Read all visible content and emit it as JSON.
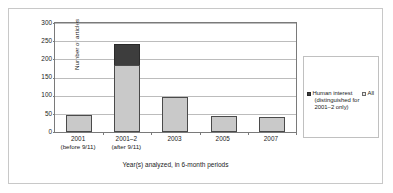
{
  "chart_data": {
    "type": "bar",
    "subtype": "stacked-column",
    "title": "",
    "xlabel": "Year(s) analyzed, in 6-month periods",
    "ylabel": "Number of articles",
    "ylim": [
      0,
      300
    ],
    "yticks": [
      0,
      50,
      100,
      150,
      200,
      250,
      300
    ],
    "grid": true,
    "legend_position": "right-outside-box",
    "categories": [
      "2001 (before 9/11)",
      "2001–2 (after 9/11)",
      "2003",
      "2005",
      "2007"
    ],
    "category_labels": [
      {
        "line1": "2001",
        "line2": "(before 9/11)"
      },
      {
        "line1": "2001–2",
        "line2": "(after 9/11)"
      },
      {
        "line1": "2003",
        "line2": ""
      },
      {
        "line1": "2005",
        "line2": ""
      },
      {
        "line1": "2007",
        "line2": ""
      }
    ],
    "series": [
      {
        "name": "All",
        "color": "#c9c9c9",
        "values": [
          48,
          185,
          96,
          45,
          41
        ]
      },
      {
        "name": "Human interest (distinguished for 2001–2 only)",
        "color": "#3d3d3d",
        "values": [
          0,
          58,
          0,
          0,
          0
        ]
      }
    ],
    "stack_totals": [
      48,
      243,
      96,
      45,
      41
    ]
  },
  "legend": {
    "human_interest": {
      "line1": "Human interest",
      "line2": "(distinguished for",
      "line3": "2001–2 only)",
      "key_color": "#3d3d3d"
    },
    "all": {
      "label": "All",
      "key_color": "#e9e9e9"
    }
  }
}
